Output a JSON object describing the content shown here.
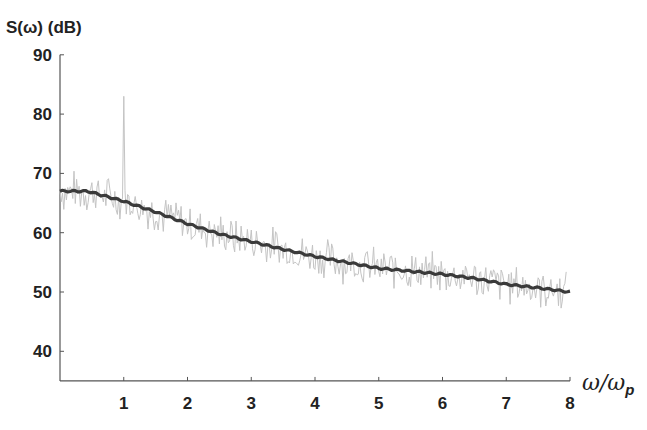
{
  "chart_data": {
    "type": "line",
    "title": "",
    "ylabel": "S(ω) (dB)",
    "xlabel": "ω/ω_p",
    "xlim": [
      0,
      8
    ],
    "ylim": [
      35,
      90
    ],
    "xticks": [
      1,
      2,
      3,
      4,
      5,
      6,
      7,
      8
    ],
    "yticks": [
      40,
      50,
      60,
      70,
      80,
      90
    ],
    "grid": false,
    "legend": null,
    "series": [
      {
        "name": "smoothed spectrum",
        "style": "thick dark line",
        "x": [
          0,
          0.2,
          0.43,
          0.7,
          1.0,
          1.5,
          2.0,
          2.5,
          3.0,
          3.5,
          4.0,
          4.5,
          5.0,
          5.5,
          6.0,
          6.5,
          7.0,
          7.5,
          8.0
        ],
        "y": [
          67,
          67,
          67,
          66.2,
          65.3,
          63.5,
          61.5,
          59.8,
          58.5,
          57.2,
          56.0,
          55.0,
          54.0,
          53.5,
          53.0,
          52.3,
          51.3,
          50.7,
          50.0
        ]
      },
      {
        "name": "raw spectrum",
        "style": "thin light gray noisy line",
        "x": [
          0,
          0.5,
          0.9,
          1.0,
          1.1,
          1.5,
          2.0,
          2.5,
          3.0,
          3.5,
          4.0,
          4.5,
          5.0,
          5.5,
          6.0,
          6.5,
          7.0,
          7.5,
          8.0
        ],
        "y": [
          68,
          67,
          66,
          83,
          64,
          63.5,
          61.5,
          60,
          58.5,
          57,
          56,
          55,
          54,
          53.5,
          53,
          52.5,
          51.5,
          50.5,
          50
        ],
        "noise_amplitude_db": 3,
        "notable_peak": {
          "x": 1.0,
          "y": 83
        }
      }
    ]
  },
  "labels": {
    "y_axis": "S(ω) (dB)",
    "x_axis_main": "ω/ω",
    "x_axis_sub": "p"
  }
}
